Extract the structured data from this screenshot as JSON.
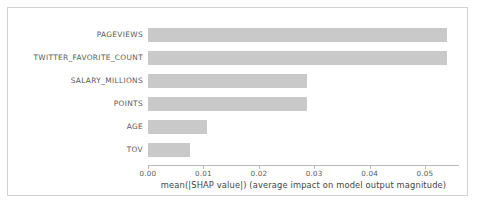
{
  "chart_data": {
    "type": "bar",
    "orientation": "horizontal",
    "title": "",
    "xlabel": "mean(|SHAP value|) (average impact on model output magnitude)",
    "ylabel": "",
    "categories": [
      "PAGEVIEWS",
      "TWITTER_FAVORITE_COUNT",
      "SALARY_MILLIONS",
      "POINTS",
      "AGE",
      "TOV"
    ],
    "values": [
      0.054,
      0.054,
      0.0287,
      0.0287,
      0.0106,
      0.0076
    ],
    "xlim": [
      0.0,
      0.0562
    ],
    "xticks": [
      0.0,
      0.01,
      0.02,
      0.03,
      0.04,
      0.05
    ],
    "xticklabels": [
      "0.00",
      "0.01",
      "0.02",
      "0.03",
      "0.04",
      "0.05"
    ],
    "grid": false,
    "legend": null,
    "bar_color": "#c9c9c9",
    "axis_color": "#b9b9b9",
    "text_color": "#5a5a5a",
    "background": "#ffffff",
    "frame_color": "#d2d2d2"
  }
}
